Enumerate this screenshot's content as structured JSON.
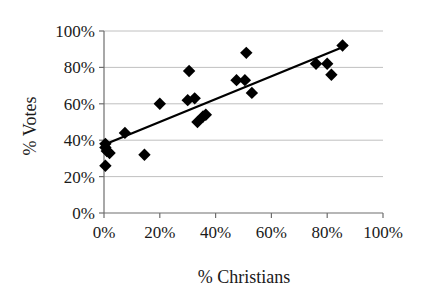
{
  "chart_data": {
    "type": "scatter",
    "title": "",
    "xlabel": "% Christians",
    "ylabel": "% Votes",
    "xlim": [
      0,
      100
    ],
    "ylim": [
      0,
      100
    ],
    "xticks": [
      "0%",
      "20%",
      "40%",
      "60%",
      "80%",
      "100%"
    ],
    "xtick_values": [
      0,
      20,
      40,
      60,
      80,
      100
    ],
    "yticks": [
      "0%",
      "20%",
      "40%",
      "60%",
      "80%",
      "100%"
    ],
    "ytick_values": [
      0,
      20,
      40,
      60,
      80,
      100
    ],
    "grid": "horizontal",
    "legend": "none",
    "marker": "diamond",
    "marker_color": "#000000",
    "points": [
      {
        "x": 0.5,
        "y": 38
      },
      {
        "x": 0.5,
        "y": 36
      },
      {
        "x": 1.0,
        "y": 34
      },
      {
        "x": 2.0,
        "y": 33
      },
      {
        "x": 0.5,
        "y": 26
      },
      {
        "x": 7.5,
        "y": 44
      },
      {
        "x": 14.5,
        "y": 32
      },
      {
        "x": 20.0,
        "y": 60
      },
      {
        "x": 30.5,
        "y": 78
      },
      {
        "x": 30.0,
        "y": 62
      },
      {
        "x": 32.5,
        "y": 63
      },
      {
        "x": 33.5,
        "y": 50
      },
      {
        "x": 35.5,
        "y": 53
      },
      {
        "x": 36.5,
        "y": 54
      },
      {
        "x": 47.5,
        "y": 73
      },
      {
        "x": 50.5,
        "y": 73
      },
      {
        "x": 51.0,
        "y": 88
      },
      {
        "x": 53.0,
        "y": 66
      },
      {
        "x": 76.0,
        "y": 82
      },
      {
        "x": 80.0,
        "y": 82
      },
      {
        "x": 81.5,
        "y": 76
      },
      {
        "x": 85.5,
        "y": 92
      }
    ],
    "trendline": {
      "x_start": 0,
      "y_start": 37.5,
      "x_end": 87,
      "y_end": 92,
      "color": "#000000"
    }
  },
  "axes": {
    "y_title": "% Votes",
    "x_title": "% Christians",
    "y_tick_labels": [
      "100%",
      "80%",
      "60%",
      "40%",
      "20%",
      "0%"
    ],
    "x_tick_labels": [
      "0%",
      "20%",
      "40%",
      "60%",
      "80%",
      "100%"
    ]
  }
}
